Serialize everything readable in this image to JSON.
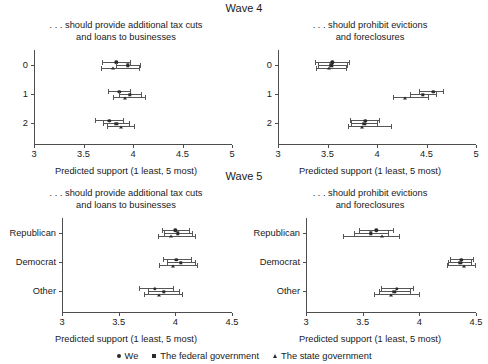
{
  "figure": {
    "wave4_header": "Wave 4",
    "wave5_header": "Wave 5",
    "x_axis_label": "Predicted support (1 least, 5 most)"
  },
  "legend": {
    "position": "bottom-center",
    "entries": [
      {
        "label": "We",
        "marker": "circle"
      },
      {
        "label": "The federal government",
        "marker": "square"
      },
      {
        "label": "The state government",
        "marker": "triangle"
      }
    ]
  },
  "chart_data": [
    {
      "type": "scatter",
      "panel": "wave4-tax-cuts",
      "title": ". . . should provide additional tax cuts\nand loans to businesses",
      "xlabel": "Predicted support (1 least, 5 most)",
      "ylabel": "",
      "xlim": [
        3,
        5
      ],
      "xticks": [
        3,
        3.5,
        4,
        4.5,
        5
      ],
      "xtick_labels": [
        "3",
        "3.5",
        "4",
        "4.5",
        "5"
      ],
      "categories": [
        "0",
        "1",
        "2"
      ],
      "grid": false,
      "series": [
        {
          "name": "We",
          "marker": "circle",
          "points": [
            {
              "category": "0",
              "value": 3.83,
              "ci_low": 3.69,
              "ci_high": 3.97
            },
            {
              "category": "1",
              "value": 3.86,
              "ci_low": 3.75,
              "ci_high": 3.97
            },
            {
              "category": "2",
              "value": 3.76,
              "ci_low": 3.62,
              "ci_high": 3.9
            }
          ]
        },
        {
          "name": "The federal government",
          "marker": "square",
          "points": [
            {
              "category": "0",
              "value": 3.95,
              "ci_low": 3.83,
              "ci_high": 4.07
            },
            {
              "category": "1",
              "value": 3.97,
              "ci_low": 3.86,
              "ci_high": 4.08
            },
            {
              "category": "2",
              "value": 3.83,
              "ci_low": 3.7,
              "ci_high": 3.96
            }
          ]
        },
        {
          "name": "The state government",
          "marker": "triangle",
          "points": [
            {
              "category": "0",
              "value": 3.8,
              "ci_low": 3.68,
              "ci_high": 4.06
            },
            {
              "category": "1",
              "value": 3.92,
              "ci_low": 3.8,
              "ci_high": 4.12
            },
            {
              "category": "2",
              "value": 3.88,
              "ci_low": 3.74,
              "ci_high": 4.01
            }
          ]
        }
      ]
    },
    {
      "type": "scatter",
      "panel": "wave4-evictions",
      "title": ". . . should prohibit evictions\nand foreclosures",
      "xlabel": "Predicted support (1 least, 5 most)",
      "ylabel": "",
      "xlim": [
        3,
        5
      ],
      "xticks": [
        3,
        3.5,
        4,
        4.5,
        5
      ],
      "xtick_labels": [
        "3",
        "3.5",
        "4",
        "4.5",
        "5"
      ],
      "categories": [
        "0",
        "1",
        "2"
      ],
      "grid": false,
      "series": [
        {
          "name": "We",
          "marker": "circle",
          "points": [
            {
              "category": "0",
              "value": 3.55,
              "ci_low": 3.37,
              "ci_high": 3.72
            },
            {
              "category": "1",
              "value": 4.57,
              "ci_low": 4.42,
              "ci_high": 4.67
            },
            {
              "category": "2",
              "value": 3.88,
              "ci_low": 3.73,
              "ci_high": 4.02
            }
          ]
        },
        {
          "name": "The federal government",
          "marker": "square",
          "points": [
            {
              "category": "0",
              "value": 3.54,
              "ci_low": 3.4,
              "ci_high": 3.7
            },
            {
              "category": "1",
              "value": 4.46,
              "ci_low": 4.33,
              "ci_high": 4.6
            },
            {
              "category": "2",
              "value": 3.87,
              "ci_low": 3.74,
              "ci_high": 4.0
            }
          ]
        },
        {
          "name": "The state government",
          "marker": "triangle",
          "points": [
            {
              "category": "0",
              "value": 3.52,
              "ci_low": 3.38,
              "ci_high": 3.69
            },
            {
              "category": "1",
              "value": 4.28,
              "ci_low": 4.16,
              "ci_high": 4.52
            },
            {
              "category": "2",
              "value": 3.85,
              "ci_low": 3.71,
              "ci_high": 4.14
            }
          ]
        }
      ]
    },
    {
      "type": "scatter",
      "panel": "wave5-tax-cuts",
      "title": ". . . should provide additional tax cuts\nand loans to businesses",
      "xlabel": "Predicted support (1 least, 5 most)",
      "ylabel": "",
      "xlim": [
        3,
        4.5
      ],
      "xticks": [
        3,
        3.5,
        4,
        4.5
      ],
      "xtick_labels": [
        "3",
        "3.5",
        "4",
        "4.5"
      ],
      "categories": [
        "Republican",
        "Democrat",
        "Other"
      ],
      "grid": false,
      "series": [
        {
          "name": "We",
          "marker": "circle",
          "points": [
            {
              "category": "Republican",
              "value": 4.0,
              "ci_low": 3.88,
              "ci_high": 4.12
            },
            {
              "category": "Democrat",
              "value": 4.01,
              "ci_low": 3.89,
              "ci_high": 4.14
            },
            {
              "category": "Other",
              "value": 3.82,
              "ci_low": 3.68,
              "ci_high": 3.98
            }
          ]
        },
        {
          "name": "The federal government",
          "marker": "square",
          "points": [
            {
              "category": "Republican",
              "value": 4.02,
              "ci_low": 3.9,
              "ci_high": 4.15
            },
            {
              "category": "Democrat",
              "value": 4.05,
              "ci_low": 3.93,
              "ci_high": 4.17
            },
            {
              "category": "Other",
              "value": 3.9,
              "ci_low": 3.76,
              "ci_high": 4.03
            }
          ]
        },
        {
          "name": "The state government",
          "marker": "triangle",
          "points": [
            {
              "category": "Republican",
              "value": 3.96,
              "ci_low": 3.85,
              "ci_high": 4.17
            },
            {
              "category": "Democrat",
              "value": 3.98,
              "ci_low": 3.86,
              "ci_high": 4.19
            },
            {
              "category": "Other",
              "value": 3.86,
              "ci_low": 3.72,
              "ci_high": 4.06
            }
          ]
        }
      ]
    },
    {
      "type": "scatter",
      "panel": "wave5-evictions",
      "title": ". . . should prohibit evictions\nand foreclosures",
      "xlabel": "Predicted support (1 least, 5 most)",
      "ylabel": "",
      "xlim": [
        3,
        4.5
      ],
      "xticks": [
        3,
        3.5,
        4,
        4.5
      ],
      "xtick_labels": [
        "3",
        "3.5",
        "4",
        "4.5"
      ],
      "categories": [
        "Republican",
        "Democrat",
        "Other"
      ],
      "grid": false,
      "series": [
        {
          "name": "We",
          "marker": "circle",
          "points": [
            {
              "category": "Republican",
              "value": 3.62,
              "ci_low": 3.47,
              "ci_high": 3.77
            },
            {
              "category": "Democrat",
              "value": 4.37,
              "ci_low": 4.27,
              "ci_high": 4.47
            },
            {
              "category": "Other",
              "value": 3.8,
              "ci_low": 3.66,
              "ci_high": 3.94
            }
          ]
        },
        {
          "name": "The federal government",
          "marker": "square",
          "points": [
            {
              "category": "Republican",
              "value": 3.57,
              "ci_low": 3.42,
              "ci_high": 3.72
            },
            {
              "category": "Democrat",
              "value": 4.36,
              "ci_low": 4.25,
              "ci_high": 4.46
            },
            {
              "category": "Other",
              "value": 3.78,
              "ci_low": 3.64,
              "ci_high": 3.92
            }
          ]
        },
        {
          "name": "The state government",
          "marker": "triangle",
          "points": [
            {
              "category": "Republican",
              "value": 3.67,
              "ci_low": 3.33,
              "ci_high": 3.82
            },
            {
              "category": "Democrat",
              "value": 4.39,
              "ci_low": 4.24,
              "ci_high": 4.49
            },
            {
              "category": "Other",
              "value": 3.75,
              "ci_low": 3.6,
              "ci_high": 4.0
            }
          ]
        }
      ]
    }
  ]
}
